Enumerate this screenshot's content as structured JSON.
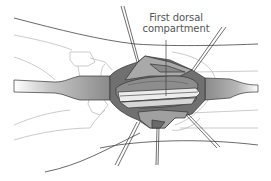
{
  "figure": {
    "type": "surgical-illustration"
  },
  "labels": {
    "annotation": {
      "line1": "First dorsal",
      "line2": "compartment"
    }
  },
  "colors": {
    "outline": "#333333",
    "skin_line": "#444444",
    "bone_line": "#b5b5b5",
    "tendon_light": "#e8e8e8",
    "tendon_mid": "#9a9a9a",
    "tissue_dark": "#6f6f6f",
    "tissue_mid": "#8d8d8d",
    "tissue_light": "#b8b8b8",
    "label_text": "#555555"
  }
}
